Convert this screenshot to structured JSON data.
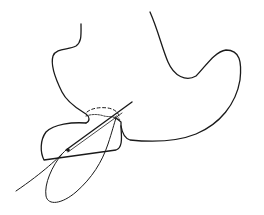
{
  "figure": {
    "colors": {
      "background": "#ffffff",
      "stroke": "#1a1a1a"
    },
    "elements": [
      {
        "name": "stomach-outline",
        "label": "stomach"
      },
      {
        "name": "tissue-flap",
        "label": "flap"
      },
      {
        "name": "dashed-margin",
        "label": "dashed line"
      },
      {
        "name": "needle",
        "label": "needle"
      },
      {
        "name": "suture-thread",
        "label": "suture"
      }
    ]
  }
}
